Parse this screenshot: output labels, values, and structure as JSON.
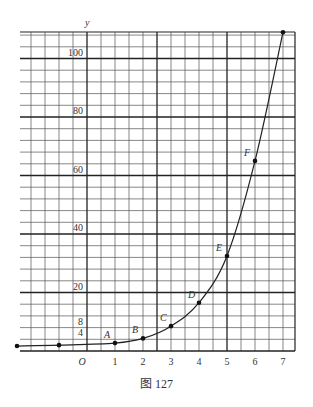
{
  "figure": {
    "caption": "图 127"
  },
  "chart_data": {
    "type": "line",
    "title": "",
    "xlabel": "",
    "ylabel": "y",
    "origin_label": "O",
    "x_tick_labels": [
      "1",
      "2",
      "3",
      "4",
      "5",
      "6",
      "7"
    ],
    "x_ticks": [
      1,
      2,
      3,
      4,
      5,
      6,
      7
    ],
    "y_tick_labels": [
      "4",
      "8",
      "20",
      "40",
      "60",
      "80",
      "100"
    ],
    "y_ticks": [
      4,
      8,
      20,
      40,
      60,
      80,
      100
    ],
    "xlim": [
      -2.5,
      7.4
    ],
    "ylim": [
      0,
      108
    ],
    "grid": true,
    "grid_minor_x": 0.5,
    "grid_minor_y": 4,
    "legend": null,
    "points": [
      {
        "label": "",
        "x": -2.5,
        "y": 1.7
      },
      {
        "label": "",
        "x": -1,
        "y": 2
      },
      {
        "label": "A",
        "x": 1,
        "y": 2.7
      },
      {
        "label": "B",
        "x": 2,
        "y": 4.3
      },
      {
        "label": "C",
        "x": 3,
        "y": 8.5
      },
      {
        "label": "D",
        "x": 4,
        "y": 16.5
      },
      {
        "label": "E",
        "x": 5,
        "y": 32.5
      },
      {
        "label": "F",
        "x": 6,
        "y": 65
      },
      {
        "label": "",
        "x": 7,
        "y": 109
      }
    ],
    "series": [
      {
        "name": "curve",
        "x": [
          -2.5,
          -1,
          1,
          2,
          3,
          4,
          5,
          6,
          7
        ],
        "y": [
          1.7,
          2,
          2.7,
          4.3,
          8.5,
          16.5,
          32.5,
          65,
          109
        ]
      }
    ]
  },
  "layout": {
    "x0_px": 87,
    "px_per_x": 28,
    "y0_px": 351,
    "px_per_y": 2.925,
    "grid_left": 20,
    "grid_right": 295,
    "grid_top": 32,
    "grid_bottom": 351,
    "line_color": "#555555",
    "bold_line_color": "#222222",
    "curve_color": "#222222"
  }
}
